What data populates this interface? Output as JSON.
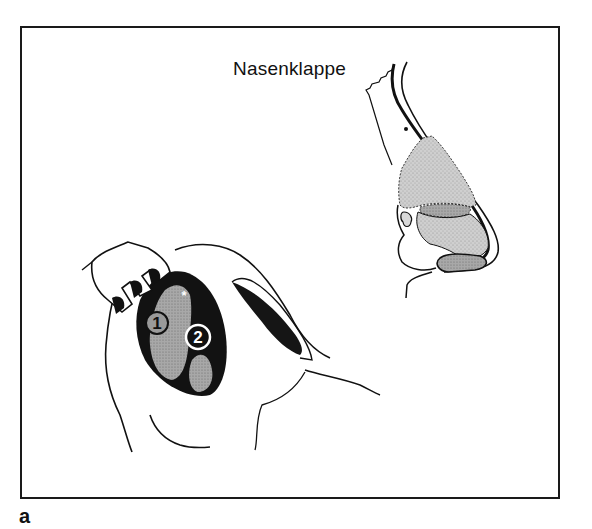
{
  "figure": {
    "title": "Nasenklappe",
    "panel_label": "a",
    "markers": [
      {
        "label": "1"
      },
      {
        "label": "2"
      },
      {
        "label": "*"
      }
    ]
  },
  "colors": {
    "line": "#111111",
    "cartilage_fill": "#c9c9c9",
    "dark_fill": "#121212",
    "mid_gray": "#8a8a8a"
  }
}
